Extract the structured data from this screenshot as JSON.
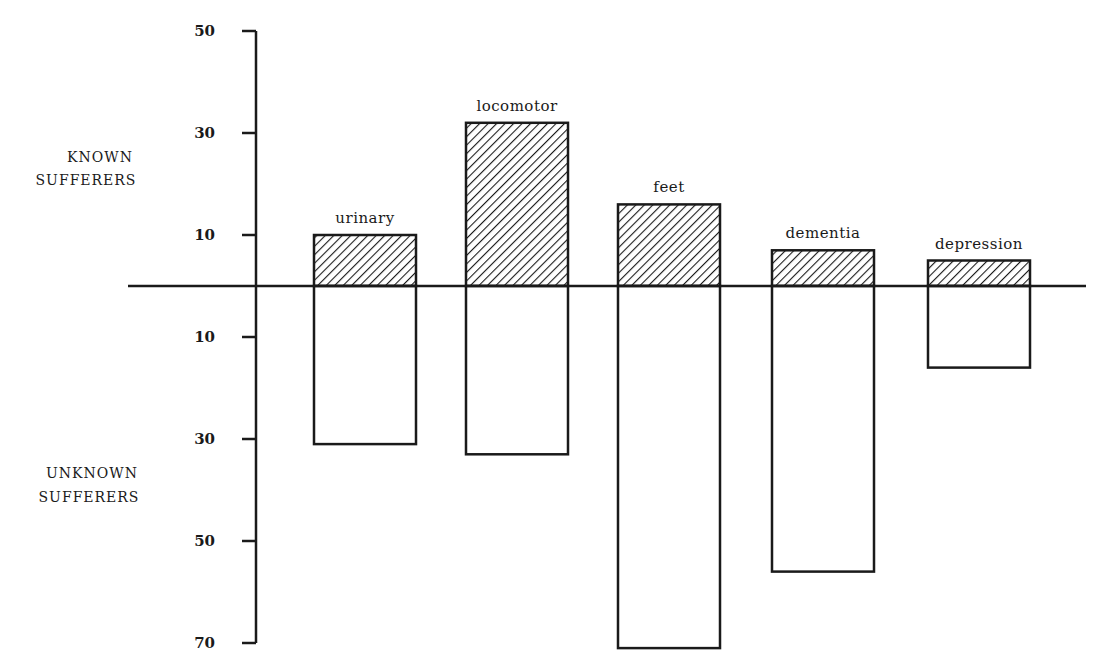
{
  "chart_data": {
    "type": "bar",
    "title": "",
    "xlabel": "",
    "ylabel": "",
    "categories": [
      "urinary",
      "locomotor",
      "feet",
      "dementia",
      "depression"
    ],
    "series": [
      {
        "name": "KNOWN SUFFERERS",
        "direction": "up",
        "fill": "hatched",
        "values": [
          10,
          32,
          16,
          7,
          5
        ]
      },
      {
        "name": "UNKNOWN SUFFERERS",
        "direction": "down",
        "fill": "open",
        "values": [
          31,
          33,
          71,
          56,
          16
        ]
      }
    ],
    "upper_ticks": [
      50,
      30,
      10
    ],
    "lower_ticks": [
      10,
      30,
      50,
      70
    ],
    "ylim_upper": [
      0,
      50
    ],
    "ylim_lower": [
      0,
      70
    ],
    "grid": false,
    "legend": "none"
  },
  "labels": {
    "known_line1": "KNOWN",
    "known_line2": "SUFFERERS",
    "unknown_line1": "UNKNOWN",
    "unknown_line2": "SUFFERERS"
  },
  "colors": {
    "ink": "#1a1a1a",
    "background": "#ffffff"
  }
}
